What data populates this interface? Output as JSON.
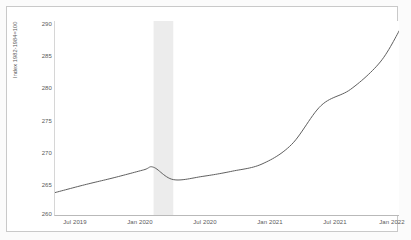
{
  "chart_data": {
    "type": "line",
    "title": "",
    "subtitle": "",
    "xlabel": "",
    "ylabel": "Index 1982-1984=100",
    "ylim": [
      260,
      290
    ],
    "yticks": [
      290,
      285,
      280,
      275,
      270,
      265,
      260
    ],
    "ytick_labels": [
      "290",
      "285",
      "280",
      "275",
      "270",
      "265",
      "260"
    ],
    "grid": false,
    "legend": "none",
    "xtick_labels": [
      "Jul 2019",
      "Jan 2020",
      "Jul 2020",
      "Jan 2021",
      "Jul 2021",
      "Jan 2022"
    ],
    "xtick_positions": [
      68,
      133,
      198,
      263,
      328,
      385
    ],
    "xlim_labels": [
      "Apr 2019",
      "Mar 2022"
    ],
    "line_color": "#5f5f5f",
    "line_width": 1.0,
    "shaded_band": {
      "label": "recession",
      "color": "#ececec",
      "x_start_label": "Feb 2020",
      "x_end_label": "Apr 2020"
    },
    "series": [
      {
        "name": "Consumer Price Index",
        "x": [
          "Apr 2019",
          "Jul 2019",
          "Oct 2019",
          "Jan 2020",
          "Feb 2020",
          "Apr 2020",
          "Jul 2020",
          "Oct 2020",
          "Jan 2021",
          "Apr 2021",
          "Jul 2021",
          "Oct 2021",
          "Jan 2022",
          "Mar 2022"
        ],
        "values": [
          263.6,
          264.8,
          265.9,
          267.1,
          267.5,
          265.6,
          266.1,
          266.9,
          268.0,
          271.0,
          277.0,
          279.5,
          283.7,
          288.7
        ]
      }
    ]
  }
}
